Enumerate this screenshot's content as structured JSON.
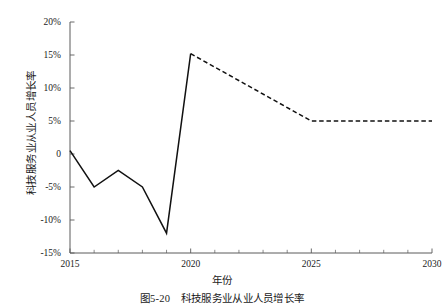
{
  "figure": {
    "y_axis_title": "科技服务业从业人员增长率",
    "x_axis_title": "年份",
    "caption": "图5-20　科技服务业从业人员增长率"
  },
  "chart_data": {
    "type": "line",
    "title": "",
    "xlabel": "年份",
    "ylabel": "科技服务业从业人员增长率",
    "xlim": [
      2015,
      2030
    ],
    "ylim": [
      -15,
      20
    ],
    "xticks": [
      2015,
      2020,
      2025,
      2030
    ],
    "xtick_labels": [
      "2015",
      "2020",
      "2025",
      "2030"
    ],
    "yticks": [
      -15,
      -10,
      -5,
      0,
      5,
      10,
      15,
      20
    ],
    "ytick_labels": [
      "-15%",
      "-10%",
      "-5%",
      "0",
      "5%",
      "10%",
      "15%",
      "20%"
    ],
    "minor_xticks": [
      2016,
      2017,
      2018,
      2019,
      2021,
      2022,
      2023,
      2024,
      2026,
      2027,
      2028,
      2029
    ],
    "grid": false,
    "legend": false,
    "legend_position": "none",
    "series": [
      {
        "name": "历史值",
        "style": "solid",
        "color": "#111111",
        "x": [
          2015,
          2016,
          2017,
          2018,
          2019,
          2020
        ],
        "values": [
          0.5,
          -5.0,
          -2.5,
          -5.0,
          -12.0,
          15.2
        ]
      },
      {
        "name": "预测值",
        "style": "dashed",
        "color": "#111111",
        "x": [
          2020,
          2025,
          2030
        ],
        "values": [
          15.2,
          5.0,
          5.0
        ]
      }
    ]
  }
}
